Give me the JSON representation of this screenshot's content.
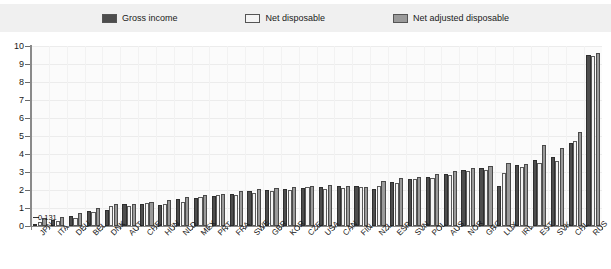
{
  "legend": {
    "items": [
      {
        "label": "Gross income",
        "color": "#4d4d4d",
        "key": "gross"
      },
      {
        "label": "Net disposable",
        "color": "#f4f4f4",
        "key": "net"
      },
      {
        "label": "Net adjusted disposable",
        "color": "#9a9a9a",
        "key": "adj"
      }
    ]
  },
  "annotation": {
    "text": "0.131"
  },
  "chart_data": {
    "type": "bar",
    "title": "",
    "subtitle": "",
    "xlabel": "",
    "ylabel": "",
    "ylim": [
      0,
      10
    ],
    "yticks": [
      0,
      1,
      2,
      3,
      4,
      5,
      6,
      7,
      8,
      9,
      10
    ],
    "ytick_labels": [
      "0",
      "1",
      "2",
      "3",
      "4",
      "5",
      "6",
      "7",
      "8",
      "9",
      "10"
    ],
    "grid": true,
    "legend_position": "top",
    "categories": [
      "JPN",
      "ITA",
      "DEU",
      "BEL",
      "DNK",
      "AUT",
      "CHE",
      "HUN",
      "NLD",
      "MEX",
      "PRT",
      "FRA",
      "SWE",
      "GBR",
      "KOR",
      "CZE",
      "USA",
      "CAN",
      "FIN",
      "NZL",
      "ESP",
      "SVN",
      "POL",
      "AUS",
      "NOR",
      "GRC",
      "LUX",
      "IRL",
      "EST",
      "SVK",
      "CHL",
      "RUS"
    ],
    "series": [
      {
        "name": "Gross income",
        "color": "#4d4d4d",
        "values": [
          0.131,
          0.35,
          0.55,
          0.85,
          0.9,
          1.2,
          1.25,
          1.15,
          1.5,
          1.55,
          1.65,
          1.8,
          1.95,
          2.0,
          2.05,
          2.1,
          2.15,
          2.2,
          2.2,
          2.05,
          2.45,
          2.6,
          2.75,
          2.9,
          3.1,
          3.2,
          2.2,
          3.4,
          3.65,
          3.85,
          4.6,
          9.5
        ]
      },
      {
        "name": "Net disposable",
        "color": "#f4f4f4",
        "values": [
          0.2,
          0.3,
          0.45,
          0.8,
          1.1,
          1.1,
          1.3,
          1.25,
          1.35,
          1.6,
          1.7,
          1.75,
          1.85,
          1.95,
          2.0,
          2.15,
          2.05,
          2.1,
          2.15,
          2.2,
          2.4,
          2.6,
          2.65,
          2.85,
          3.05,
          3.1,
          2.95,
          3.3,
          3.5,
          3.6,
          4.75,
          9.45
        ]
      },
      {
        "name": "Net adjusted disposable",
        "color": "#9a9a9a",
        "values": [
          0.45,
          0.5,
          0.75,
          1.0,
          1.2,
          1.25,
          1.35,
          1.45,
          1.6,
          1.75,
          1.8,
          1.95,
          2.05,
          2.1,
          2.15,
          2.2,
          2.3,
          2.25,
          2.15,
          2.5,
          2.65,
          2.75,
          2.9,
          3.05,
          3.25,
          3.35,
          3.5,
          3.45,
          4.5,
          4.35,
          5.2,
          9.6
        ]
      }
    ]
  }
}
